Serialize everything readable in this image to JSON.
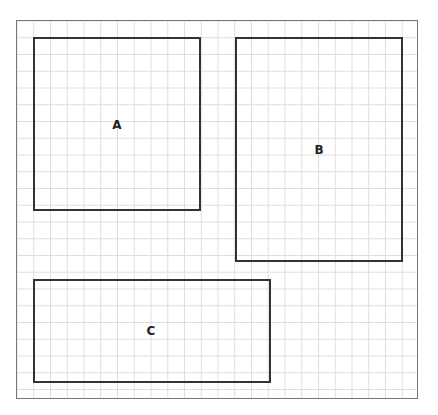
{
  "diagram": {
    "type": "grid-rectangles",
    "grid": {
      "cell_size_px": 16.76,
      "line_color": "#dedede",
      "frame_color": "#777777"
    },
    "frame": {
      "x": 16,
      "y": 20,
      "width": 402,
      "height": 379
    },
    "shapes": [
      {
        "id": "A",
        "label": "A",
        "x": 33,
        "y": 37,
        "width": 168,
        "height": 174,
        "label_x": 117,
        "label_y": 125
      },
      {
        "id": "B",
        "label": "B",
        "x": 235,
        "y": 37,
        "width": 168,
        "height": 225,
        "label_x": 319,
        "label_y": 150
      },
      {
        "id": "C",
        "label": "C",
        "x": 33,
        "y": 279,
        "width": 238,
        "height": 104,
        "label_x": 151,
        "label_y": 331
      }
    ],
    "stroke_color": "#333333"
  }
}
